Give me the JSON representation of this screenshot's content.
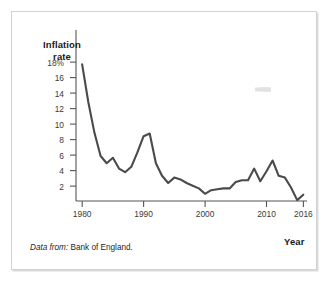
{
  "figure": {
    "source_note_emphasis": "Data from:",
    "source_note_text": " Bank of England."
  },
  "chart_data": {
    "type": "line",
    "title": "",
    "subtitle": "",
    "xlabel": "Year",
    "ylabel": "Inflation rate",
    "ylabel_line1": "Inflation",
    "ylabel_line2": "rate",
    "xlim": [
      1979.0,
      2016.6
    ],
    "ylim": [
      0,
      19
    ],
    "grid": false,
    "legend": false,
    "line_color": "#4a4a4a",
    "axis_color": "#555555",
    "ytick_labels": [
      "18%",
      "16",
      "14",
      "12",
      "10",
      "8",
      "6",
      "4",
      "2"
    ],
    "ytick_values": [
      18,
      16,
      14,
      12,
      10,
      8,
      6,
      4,
      2
    ],
    "xtick_labels": [
      "1980",
      "1990",
      "2000",
      "2010",
      "2016"
    ],
    "xtick_values": [
      1980,
      1990,
      2000,
      2010,
      2016
    ],
    "series": [
      {
        "name": "UK inflation rate",
        "x": [
          1980,
          1981,
          1982,
          1983,
          1984,
          1985,
          1986,
          1987,
          1988,
          1989,
          1990,
          1991,
          1992,
          1993,
          1994,
          1995,
          1996,
          1997,
          1998,
          1999,
          2000,
          2001,
          2002,
          2003,
          2004,
          2005,
          2006,
          2007,
          2008,
          2009,
          2010,
          2011,
          2012,
          2013,
          2014,
          2015,
          2016
        ],
        "values": [
          15.2,
          11.0,
          7.6,
          5.0,
          4.2,
          4.8,
          3.6,
          3.2,
          3.8,
          5.4,
          7.2,
          7.5,
          4.2,
          2.8,
          2.0,
          2.6,
          2.4,
          2.0,
          1.7,
          1.4,
          0.8,
          1.2,
          1.3,
          1.4,
          1.4,
          2.1,
          2.3,
          2.3,
          3.6,
          2.2,
          3.3,
          4.5,
          2.8,
          2.6,
          1.5,
          0.1,
          0.7
        ],
        "color": "#4a4a4a"
      }
    ]
  }
}
